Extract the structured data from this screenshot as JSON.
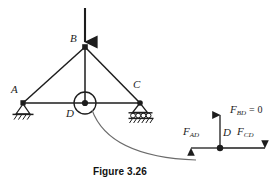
{
  "figure": {
    "caption": "Figure 3.26",
    "ink_color": "#1d1d1d",
    "paper_color": "#ffffff"
  },
  "truss": {
    "name": "planar-truss",
    "joints": [
      {
        "id": "A",
        "label": "A",
        "x": 23,
        "y": 103,
        "support": "pin"
      },
      {
        "id": "B",
        "label": "B",
        "x": 85,
        "y": 47,
        "support": "none"
      },
      {
        "id": "C",
        "label": "C",
        "x": 140,
        "y": 103,
        "support": "roller"
      },
      {
        "id": "D",
        "label": "D",
        "x": 85,
        "y": 103,
        "support": "none"
      }
    ],
    "members": [
      {
        "from": "A",
        "to": "B"
      },
      {
        "from": "B",
        "to": "C"
      },
      {
        "from": "A",
        "to": "C"
      },
      {
        "from": "B",
        "to": "D"
      }
    ],
    "load": {
      "label": "",
      "at_joint": "B",
      "direction": "down",
      "tail_y": 8,
      "head_y": 45
    },
    "callout": {
      "name": "joint-d-callout-circle",
      "cx": 85,
      "cy": 103,
      "r": 11
    },
    "artifact_curve": {
      "name": "scan-artifact-curve",
      "path": "M 92 110 C 104 143, 140 158, 196 160"
    }
  },
  "fbd": {
    "name": "joint-d-free-body-diagram",
    "origin": {
      "x": 220,
      "y": 148
    },
    "joint_label": "D",
    "forces": [
      {
        "id": "FBD",
        "base": "F",
        "sub": "BD",
        "equals": "= 0",
        "direction": "up",
        "label_x": 228,
        "label_y": 108,
        "tail_x": 220,
        "tail_y": 148,
        "head_x": 220,
        "head_y": 112
      },
      {
        "id": "FAD",
        "base": "F",
        "sub": "AD",
        "equals": "",
        "direction": "left",
        "label_x": 182,
        "label_y": 130,
        "tail_x": 220,
        "tail_y": 148,
        "head_x": 188,
        "head_y": 148
      },
      {
        "id": "FCD",
        "base": "F",
        "sub": "CD",
        "equals": "",
        "direction": "right",
        "label_x": 238,
        "label_y": 130,
        "tail_x": 220,
        "tail_y": 148,
        "head_x": 268,
        "head_y": 148
      }
    ]
  }
}
